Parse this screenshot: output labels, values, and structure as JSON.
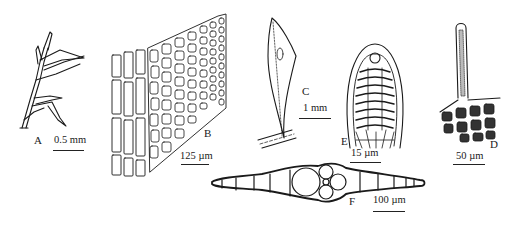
{
  "figure": {
    "panels": [
      {
        "id": "A",
        "label": "A",
        "subject": "shoot-habit",
        "scale": "0.5 mm"
      },
      {
        "id": "B",
        "label": "B",
        "subject": "leaf-cells",
        "scale": "125 µm"
      },
      {
        "id": "C",
        "label": "C",
        "subject": "leaf",
        "scale": "1 mm"
      },
      {
        "id": "D",
        "label": "D",
        "subject": "gemma-hair",
        "scale": "50 µm"
      },
      {
        "id": "E",
        "label": "E",
        "subject": "leaf-apex",
        "scale": "15 µm"
      },
      {
        "id": "F",
        "label": "F",
        "subject": "leaf-cross-section",
        "scale": "100 µm"
      }
    ],
    "colors": {
      "ink": "#1a1a1a",
      "background": "#ffffff"
    }
  }
}
